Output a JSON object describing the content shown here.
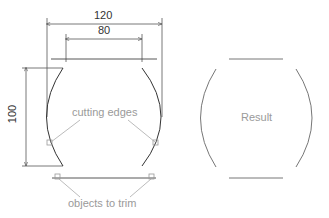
{
  "diagram": {
    "dimensions": {
      "overall_width": "120",
      "inner_width": "80",
      "height": "100"
    },
    "annotations": {
      "cutting_edges": "cutting edges",
      "objects_to_trim": "objects to trim",
      "result": "Result"
    },
    "colors": {
      "geometry": "#444444",
      "dimension": "#555555",
      "annotation": "#9a9a9a",
      "result_geometry": "#666666"
    }
  }
}
